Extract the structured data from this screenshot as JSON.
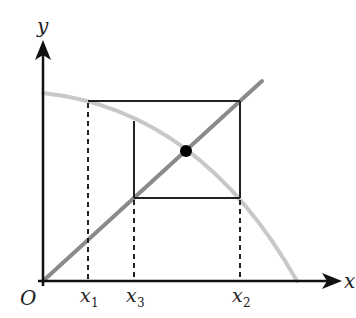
{
  "diagram": {
    "axes": {
      "x_label": "x",
      "y_label": "y",
      "origin_label": "O"
    },
    "ticks": [
      {
        "label": "x",
        "sub": "1"
      },
      {
        "label": "x",
        "sub": "3"
      },
      {
        "label": "x",
        "sub": "2"
      }
    ],
    "elements": {
      "curve": "decreasing concave curve y = f(x)",
      "line": "line y = x",
      "fixed_point": "intersection point",
      "cobweb": "rectangular cobweb path"
    },
    "colors": {
      "axis": "#111111",
      "curve": "#c8c8c8",
      "line": "#8a8a8a",
      "cobweb": "#222222",
      "point": "#000000"
    }
  }
}
